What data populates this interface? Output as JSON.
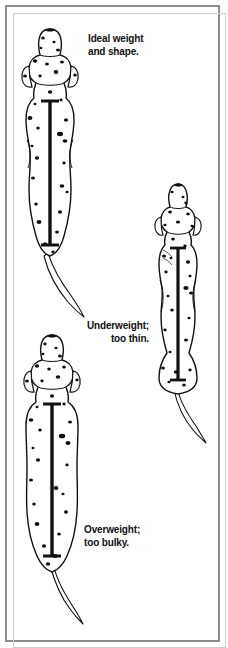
{
  "panel": {
    "background_color": "#ffffff",
    "frame_color": "#8c8c8c",
    "ink_color": "#111111",
    "width": 228,
    "height": 647
  },
  "illustration": {
    "subject": "dalmatian-dog-top-down-view",
    "view": "overhead",
    "purpose": "body-condition-score-comparison",
    "figure_count": 3
  },
  "captions": {
    "ideal": "Ideal weight\nand shape.",
    "underweight": "Underweight;\ntoo thin.",
    "overweight": "Overweight;\ntoo bulky."
  },
  "figures": [
    {
      "id": "dog-ideal",
      "label": "Ideal weight and shape.",
      "condition": "ideal",
      "spine_bar": true,
      "spot_count": 24,
      "body_width_ratio": 1.0
    },
    {
      "id": "dog-underweight",
      "label": "Underweight; too thin.",
      "condition": "underweight",
      "spine_bar": true,
      "spot_count": 21,
      "body_width_ratio": 0.78
    },
    {
      "id": "dog-overweight",
      "label": "Overweight; too bulky.",
      "condition": "overweight",
      "spine_bar": true,
      "spot_count": 28,
      "body_width_ratio": 1.22
    }
  ]
}
